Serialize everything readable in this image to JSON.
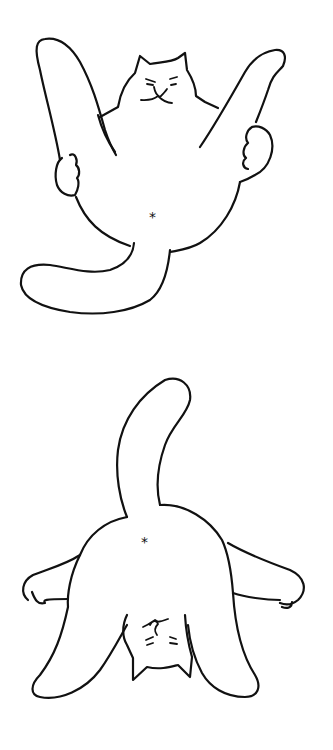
{
  "illustration": {
    "subject": "two line-drawn cats",
    "panels": [
      {
        "name": "cat-lying-on-back",
        "description": "Cat lying on its back with legs raised, holding its hind legs with front paws, belly button asterisk, tail curling to lower left",
        "navel_glyph": "*"
      },
      {
        "name": "cat-upside-down",
        "description": "Same cat viewed upside down with tail pointing up, legs splayed, face at the bottom",
        "navel_glyph": "*"
      }
    ],
    "colors": {
      "background": "#ffffff",
      "line": "#111111"
    }
  }
}
